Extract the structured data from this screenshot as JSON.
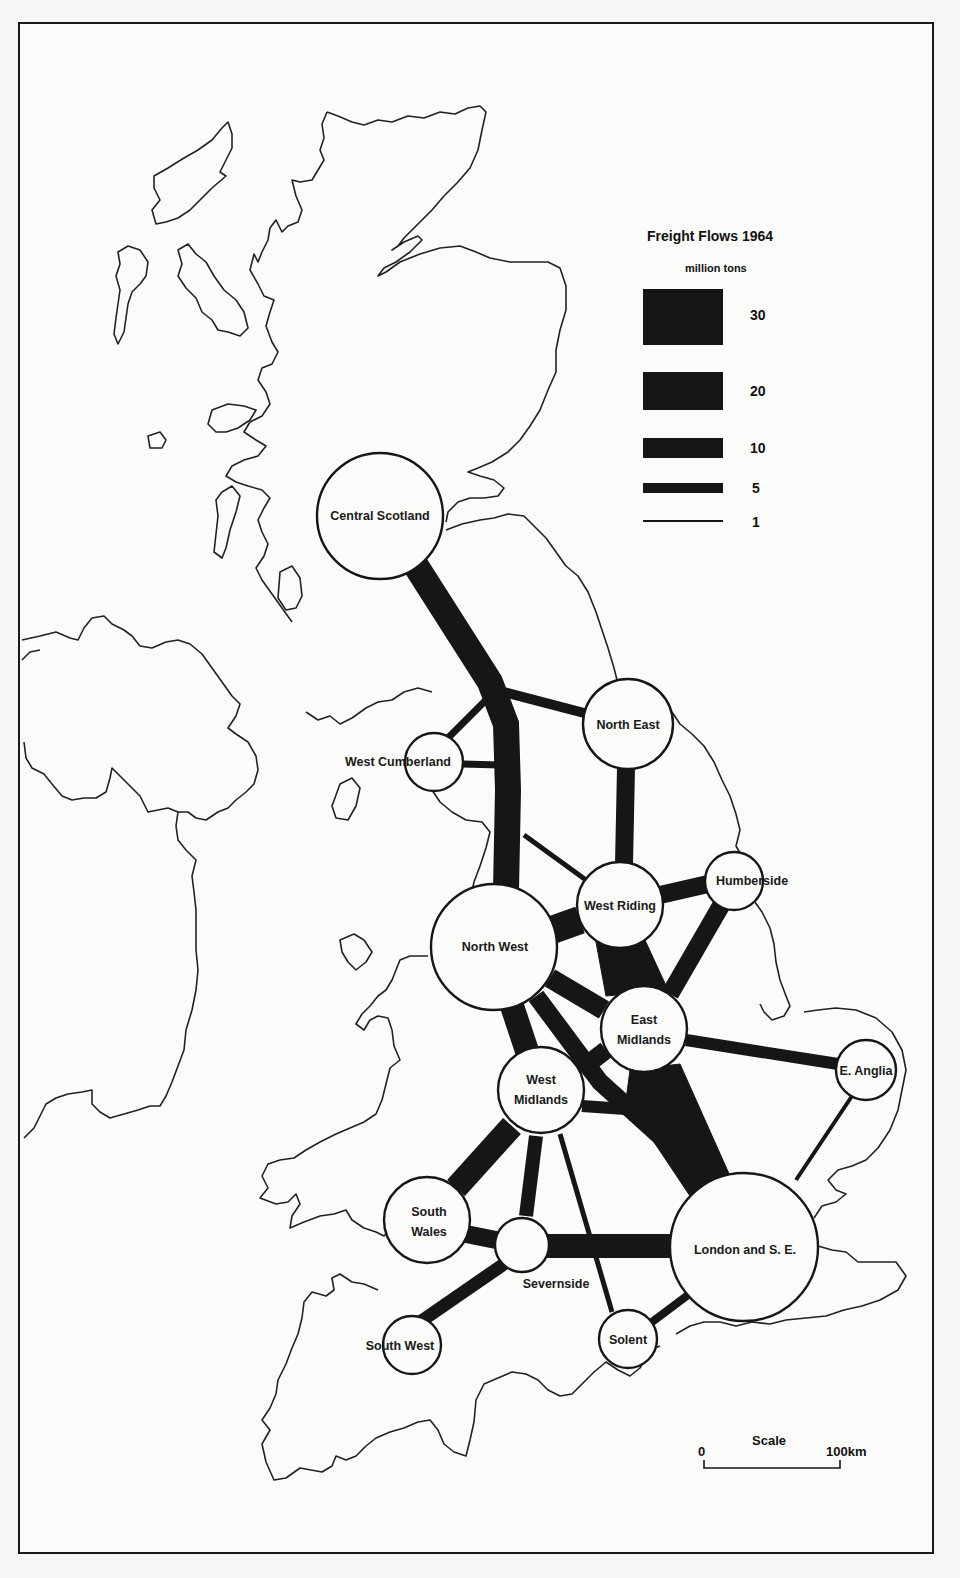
{
  "title": "Freight Flows 1964",
  "legend": {
    "title": "Freight Flows 1964",
    "unit": "million tons",
    "items": [
      {
        "value": "30",
        "label": "30"
      },
      {
        "value": "20",
        "label": "20"
      },
      {
        "value": "10",
        "label": "10"
      },
      {
        "value": "5",
        "label": "5"
      },
      {
        "value": "1",
        "label": "1"
      }
    ]
  },
  "scale": {
    "title": "Scale",
    "start_label": "0",
    "end_label": "100km"
  },
  "regions": [
    {
      "id": "central-scotland",
      "label": "Central Scotland"
    },
    {
      "id": "north-east",
      "label": "North East"
    },
    {
      "id": "west-cumberland",
      "label": "West Cumberland"
    },
    {
      "id": "west-riding",
      "label": "West Riding"
    },
    {
      "id": "humberside",
      "label": "Humberside"
    },
    {
      "id": "north-west",
      "label": "North West"
    },
    {
      "id": "east-midlands",
      "label_line1": "East",
      "label_line2": "Midlands"
    },
    {
      "id": "e-anglia",
      "label": "E.  Anglia"
    },
    {
      "id": "west-midlands",
      "label_line1": "West",
      "label_line2": "Midlands"
    },
    {
      "id": "south-wales",
      "label_line1": "South",
      "label_line2": "Wales"
    },
    {
      "id": "severnside",
      "label": "Severnside"
    },
    {
      "id": "south-west",
      "label": "South West"
    },
    {
      "id": "solent",
      "label": "Solent"
    },
    {
      "id": "london-se",
      "label": "London  and  S. E."
    }
  ],
  "flows_million_tons_approx": [
    {
      "from": "Central Scotland",
      "to": "North West",
      "value": 20
    },
    {
      "from": "Central Scotland",
      "to": "North East",
      "value": 5
    },
    {
      "from": "West Cumberland",
      "to": "North West",
      "value": 3
    },
    {
      "from": "West Cumberland",
      "to": "North West (main trunk)",
      "value": 3
    },
    {
      "from": "North East",
      "to": "West Riding",
      "value": 10
    },
    {
      "from": "North West",
      "to": "West Riding",
      "value": 20
    },
    {
      "from": "North West",
      "to": "North West trunk / West Riding link",
      "value": 2
    },
    {
      "from": "West Riding",
      "to": "Humberside",
      "value": 10
    },
    {
      "from": "West Riding",
      "to": "East Midlands",
      "value": 20
    },
    {
      "from": "Humberside",
      "to": "East Midlands",
      "value": 10
    },
    {
      "from": "North West",
      "to": "East Midlands",
      "value": 10
    },
    {
      "from": "North West",
      "to": "West Midlands",
      "value": 10
    },
    {
      "from": "North West",
      "to": "London and S.E.",
      "value": 10
    },
    {
      "from": "East Midlands",
      "to": "West Midlands",
      "value": 10
    },
    {
      "from": "East Midlands",
      "to": "London and S.E.",
      "value": 30
    },
    {
      "from": "East Midlands",
      "to": "E. Anglia",
      "value": 5
    },
    {
      "from": "E. Anglia",
      "to": "London and S.E.",
      "value": 2
    },
    {
      "from": "West Midlands",
      "to": "South Wales",
      "value": 10
    },
    {
      "from": "West Midlands",
      "to": "Severnside",
      "value": 5
    },
    {
      "from": "West Midlands",
      "to": "Solent",
      "value": 2
    },
    {
      "from": "West Midlands",
      "to": "London and S.E.",
      "value": 5
    },
    {
      "from": "South Wales",
      "to": "Severnside",
      "value": 5
    },
    {
      "from": "Severnside",
      "to": "London and S.E.",
      "value": 10
    },
    {
      "from": "Severnside",
      "to": "South West",
      "value": 5
    },
    {
      "from": "Solent",
      "to": "London and S.E.",
      "value": 3
    }
  ]
}
